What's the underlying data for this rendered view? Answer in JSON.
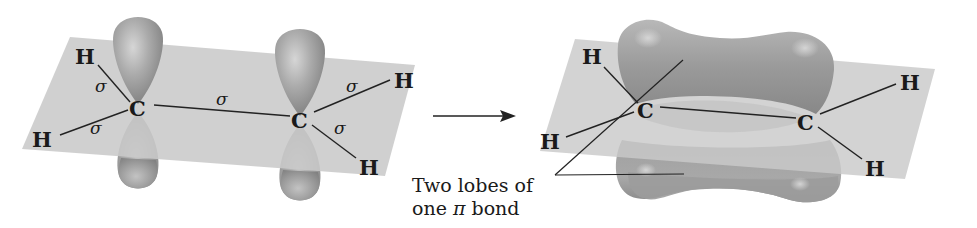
{
  "figure": {
    "left_panel": {
      "description": "Two sp2-hybridized carbons with unhybridized p orbitals perpendicular to the molecular plane",
      "atoms": [
        {
          "label": "H",
          "role": "upper-left-hydrogen"
        },
        {
          "label": "H",
          "role": "lower-left-hydrogen"
        },
        {
          "label": "C",
          "role": "left-carbon"
        },
        {
          "label": "C",
          "role": "right-carbon"
        },
        {
          "label": "H",
          "role": "upper-right-hydrogen"
        },
        {
          "label": "H",
          "role": "lower-right-hydrogen"
        }
      ],
      "sigma_labels": [
        "σ",
        "σ",
        "σ",
        "σ",
        "σ"
      ]
    },
    "arrow": {
      "direction": "right"
    },
    "right_panel": {
      "description": "Overlapping p orbitals form one pi bond with two lobes above and below the plane",
      "atoms": [
        {
          "label": "H",
          "role": "upper-left-hydrogen"
        },
        {
          "label": "H",
          "role": "lower-left-hydrogen"
        },
        {
          "label": "C",
          "role": "left-carbon"
        },
        {
          "label": "C",
          "role": "right-carbon"
        },
        {
          "label": "H",
          "role": "upper-right-hydrogen"
        },
        {
          "label": "H",
          "role": "lower-right-hydrogen"
        }
      ]
    },
    "caption": {
      "line1": "Two lobes of",
      "line2_prefix": "one ",
      "line2_symbol": "π",
      "line2_suffix": " bond"
    },
    "colors": {
      "plane": "#c9c9c9",
      "lobe": "#9a9a9a",
      "lobe_highlight": "#d4d4d4",
      "bond_line": "#222222"
    }
  }
}
